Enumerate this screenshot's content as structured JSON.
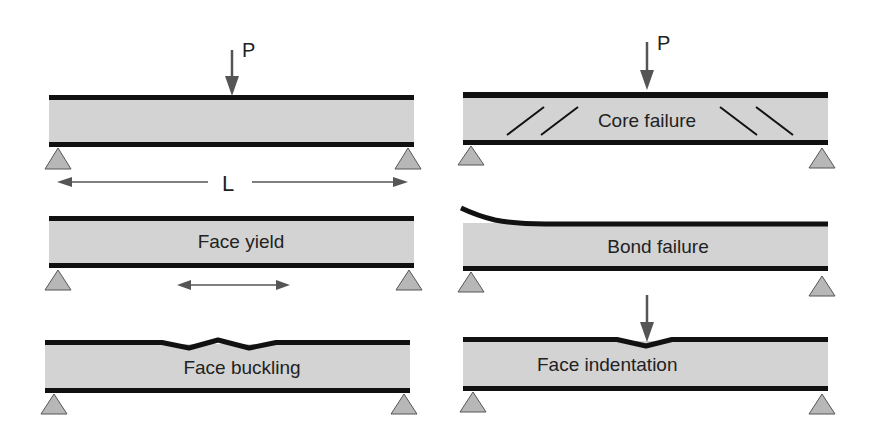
{
  "figure": {
    "colors": {
      "core_fill": "#d3d3d3",
      "face_stroke": "#111111",
      "support_fill": "#b7b7b7",
      "support_stroke": "#555555",
      "arrow": "#555555",
      "text": "#222222",
      "background": "#ffffff"
    },
    "load_label": "P",
    "span_label": "L",
    "panels": [
      {
        "id": "loaded-beam",
        "label": "",
        "has_load_arrow": true,
        "has_span_dimension": true
      },
      {
        "id": "core-failure",
        "label": "Core failure",
        "has_load_arrow": true,
        "shear_crack_count": 4
      },
      {
        "id": "face-yield",
        "label": "Face yield",
        "has_tension_arrow": true
      },
      {
        "id": "bond-failure",
        "label": "Bond failure",
        "debonded_face": "top-left"
      },
      {
        "id": "face-buckling",
        "label": "Face buckling",
        "wrinkled_face": "top"
      },
      {
        "id": "face-indentation",
        "label": "Face indentation",
        "has_load_arrow": true
      }
    ]
  }
}
